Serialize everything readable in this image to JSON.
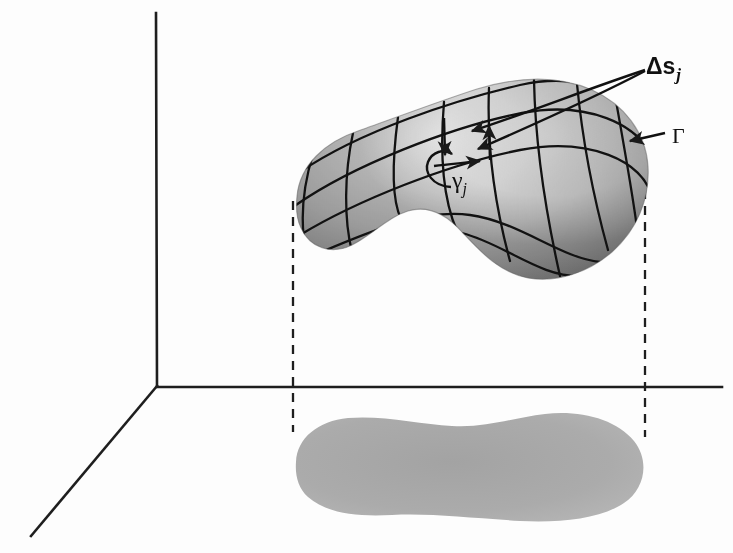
{
  "figure": {
    "background_color": "#fdfdfd",
    "ink_color": "#1a1a1a",
    "shadow_color": "#a9a9a9",
    "surface_light": "#efefef",
    "surface_mid": "#c9c9c9",
    "surface_dark": "#8f8f8f"
  },
  "labels": {
    "delta_s": {
      "text": "Δs",
      "subscript": "j",
      "x": 648,
      "y": 56
    },
    "gamma_small": {
      "text": "γ",
      "subscript": "j",
      "x": 452,
      "y": 166
    },
    "gamma_big": {
      "text": "Γ",
      "x": 672,
      "y": 126
    }
  },
  "axes": {
    "origin": {
      "x": 157,
      "y": 386
    },
    "vertical_top": {
      "x": 156,
      "y": 13
    },
    "horizontal_end": {
      "x": 722,
      "y": 387
    },
    "diagonal_end": {
      "x": 31,
      "y": 536
    }
  },
  "projection_lines": [
    {
      "name": "left-dashed-drop",
      "x": 293,
      "y1": 200,
      "y2": 430
    },
    {
      "name": "right-dashed-drop",
      "x": 645,
      "y1": 157,
      "y2": 437
    }
  ],
  "annotations": {
    "gamma_arrow": {
      "from_x": 663,
      "from_y": 132,
      "to_x": 629,
      "to_y": 141
    },
    "leader_lines": 2,
    "cell_arrows": [
      "up-arrow",
      "down-arrow",
      "right-arrow"
    ],
    "circulation": "counterclockwise"
  }
}
